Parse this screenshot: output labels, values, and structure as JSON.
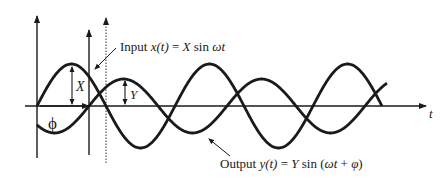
{
  "diagram": {
    "input_label": {
      "prefix": "Input ",
      "func": "x",
      "arg": "(t)",
      "eq": " = ",
      "amp": "X",
      "fn": " sin ",
      "omega_t": "ωt"
    },
    "output_label": {
      "prefix": "Output ",
      "func": "y",
      "arg": "(t)",
      "eq": " = ",
      "amp": "Y",
      "fn": " sin (",
      "omega_t": "ωt",
      "plus": " + ",
      "phi": "φ",
      "close": ")"
    },
    "axis_label_t": "t",
    "amplitude_x_label": "X",
    "amplitude_y_label": "Y",
    "phase_label": "ϕ",
    "colors": {
      "stroke": "#1a1a1a",
      "background": "#ffffff"
    }
  }
}
